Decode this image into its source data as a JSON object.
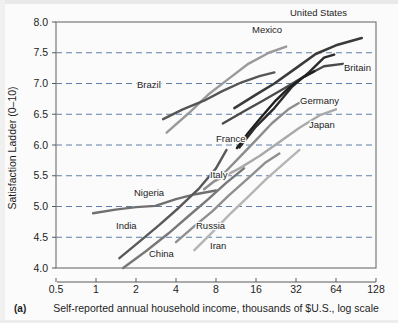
{
  "figure": {
    "panel_letter": "(a)",
    "background_color": "#fbfbfb",
    "frame_color": "#7a7a7a",
    "gridline_color": "#5f7fa8"
  },
  "chart_data": {
    "type": "line",
    "title": "",
    "subtitle": "",
    "xlabel": "Self-reported annual household income, thousands of $U.S., log scale",
    "ylabel": "Satisfaction Ladder (0–10)",
    "xscale": "log",
    "xlim": [
      0.5,
      128
    ],
    "ylim": [
      4.0,
      8.0
    ],
    "xticks": [
      0.5,
      1,
      2,
      4,
      8,
      16,
      32,
      64,
      128
    ],
    "xticklabels": [
      "0.5",
      "1",
      "2",
      "4",
      "8",
      "16",
      "32",
      "64",
      "128"
    ],
    "yticks": [
      4.0,
      4.5,
      5.0,
      5.5,
      6.0,
      6.5,
      7.0,
      7.5,
      8.0
    ],
    "yticklabels": [
      "4.0",
      "4.5",
      "5.0",
      "5.5",
      "6.0",
      "6.5",
      "7.0",
      "7.5",
      "8.0"
    ],
    "grid": "horizontal-dashed",
    "legend": "inline-labels",
    "series": [
      {
        "name": "United States",
        "color": "#3a3a3a",
        "width": 2.6,
        "label_x": 290,
        "label_y": 16,
        "points": [
          [
            11.0,
            6.6
          ],
          [
            16.0,
            6.82
          ],
          [
            22.0,
            7.0
          ],
          [
            32.0,
            7.25
          ],
          [
            45.0,
            7.48
          ],
          [
            64.0,
            7.62
          ],
          [
            100.0,
            7.74
          ]
        ]
      },
      {
        "name": "Britain",
        "color": "#4a4a4a",
        "width": 2.4,
        "label_x": 344,
        "label_y": 71,
        "points": [
          [
            9.0,
            6.35
          ],
          [
            13.0,
            6.55
          ],
          [
            18.0,
            6.72
          ],
          [
            26.0,
            6.92
          ],
          [
            36.0,
            7.1
          ],
          [
            52.0,
            7.28
          ],
          [
            72.0,
            7.32
          ]
        ]
      },
      {
        "name": "Germany",
        "color": "#2b2b2b",
        "width": 2.4,
        "label_x": 300,
        "label_y": 104,
        "points": [
          [
            12.0,
            5.96
          ],
          [
            16.0,
            6.3
          ],
          [
            22.0,
            6.6
          ],
          [
            30.0,
            6.95
          ],
          [
            40.0,
            7.18
          ],
          [
            52.0,
            7.42
          ],
          [
            62.0,
            7.47
          ]
        ]
      },
      {
        "name": "Japan",
        "color": "#a9a9a9",
        "width": 2.4,
        "label_x": 309,
        "label_y": 128,
        "points": [
          [
            8.0,
            5.42
          ],
          [
            12.0,
            5.62
          ],
          [
            17.0,
            5.82
          ],
          [
            24.0,
            6.05
          ],
          [
            34.0,
            6.28
          ],
          [
            48.0,
            6.48
          ],
          [
            64.0,
            6.58
          ]
        ]
      },
      {
        "name": "Mexico",
        "color": "#9a9a9a",
        "width": 2.4,
        "label_x": 252,
        "label_y": 33,
        "points": [
          [
            3.4,
            6.2
          ],
          [
            5.0,
            6.52
          ],
          [
            7.0,
            6.82
          ],
          [
            10.0,
            7.08
          ],
          [
            14.0,
            7.32
          ],
          [
            20.0,
            7.5
          ],
          [
            27.0,
            7.6
          ]
        ]
      },
      {
        "name": "Brazil",
        "color": "#555555",
        "width": 2.4,
        "label_x": 137,
        "label_y": 88,
        "points": [
          [
            3.2,
            6.42
          ],
          [
            4.5,
            6.58
          ],
          [
            6.5,
            6.72
          ],
          [
            9.0,
            6.88
          ],
          [
            12.5,
            7.02
          ],
          [
            17.0,
            7.12
          ],
          [
            22.0,
            7.18
          ]
        ]
      },
      {
        "name": "France",
        "color": "#1f1f1f",
        "width": 2.4,
        "label_x": 216,
        "label_y": 142,
        "points": [
          [
            11.5,
            5.95
          ],
          [
            14.0,
            6.2
          ],
          [
            17.5,
            6.45
          ],
          [
            22.0,
            6.7
          ],
          [
            28.0,
            6.92
          ],
          [
            36.0,
            7.1
          ],
          [
            44.0,
            7.2
          ]
        ]
      },
      {
        "name": "Italy",
        "color": "#8c8c8c",
        "width": 2.4,
        "label_x": 210,
        "label_y": 178,
        "points": [
          [
            6.5,
            5.28
          ],
          [
            9.0,
            5.52
          ],
          [
            12.0,
            5.8
          ],
          [
            16.0,
            6.08
          ],
          [
            21.0,
            6.35
          ],
          [
            28.0,
            6.58
          ],
          [
            36.0,
            6.72
          ]
        ]
      },
      {
        "name": "Nigeria",
        "color": "#6f6f6f",
        "width": 2.4,
        "label_x": 134,
        "label_y": 196,
        "points": [
          [
            0.95,
            4.89
          ],
          [
            1.4,
            4.95
          ],
          [
            2.0,
            4.99
          ],
          [
            2.8,
            5.01
          ],
          [
            4.0,
            5.12
          ],
          [
            5.6,
            5.2
          ],
          [
            8.0,
            5.26
          ]
        ]
      },
      {
        "name": "India",
        "color": "#595959",
        "width": 2.4,
        "label_x": 116,
        "label_y": 229,
        "points": [
          [
            1.5,
            4.16
          ],
          [
            2.1,
            4.42
          ],
          [
            3.0,
            4.7
          ],
          [
            4.2,
            4.98
          ],
          [
            6.0,
            5.3
          ],
          [
            8.0,
            5.62
          ],
          [
            9.6,
            5.92
          ]
        ]
      },
      {
        "name": "China",
        "color": "#787878",
        "width": 2.4,
        "label_x": 149,
        "label_y": 257,
        "points": [
          [
            1.6,
            4.0
          ],
          [
            2.4,
            4.28
          ],
          [
            3.5,
            4.56
          ],
          [
            5.0,
            4.85
          ],
          [
            7.0,
            5.12
          ],
          [
            9.5,
            5.38
          ],
          [
            13.0,
            5.62
          ]
        ]
      },
      {
        "name": "Russia",
        "color": "#8f8f8f",
        "width": 2.4,
        "label_x": 196,
        "label_y": 229,
        "points": [
          [
            4.0,
            4.42
          ],
          [
            5.5,
            4.68
          ],
          [
            7.5,
            4.92
          ],
          [
            10.0,
            5.18
          ],
          [
            14.0,
            5.46
          ],
          [
            19.0,
            5.72
          ],
          [
            24.0,
            5.86
          ]
        ]
      },
      {
        "name": "Iran",
        "color": "#b5b5b5",
        "width": 2.4,
        "label_x": 210,
        "label_y": 249,
        "points": [
          [
            5.5,
            4.29
          ],
          [
            7.5,
            4.58
          ],
          [
            10.0,
            4.86
          ],
          [
            14.0,
            5.16
          ],
          [
            19.0,
            5.44
          ],
          [
            26.0,
            5.7
          ],
          [
            34.0,
            5.92
          ]
        ]
      }
    ]
  }
}
